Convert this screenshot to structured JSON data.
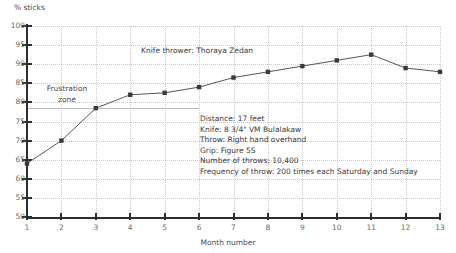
{
  "chart_data": {
    "type": "line",
    "title": "Knife thrower: Thoraya Zedan",
    "xlabel": "Month number",
    "ylabel": "% sticks",
    "x": [
      1,
      2,
      3,
      4,
      5,
      6,
      7,
      8,
      9,
      10,
      11,
      12,
      13
    ],
    "values": [
      64,
      70,
      78.5,
      82,
      82.5,
      84,
      86.5,
      88,
      89.5,
      91,
      92.5,
      89,
      88
    ],
    "series": [
      {
        "name": "% sticks",
        "values": [
          64,
          70,
          78.5,
          82,
          82.5,
          84,
          86.5,
          88,
          89.5,
          91,
          92.5,
          89,
          88
        ]
      }
    ],
    "xlim": [
      1,
      13
    ],
    "ylim": [
      50,
      100
    ],
    "ytick_labels": [
      "50",
      "55",
      "60",
      "65",
      "70",
      "75",
      "80",
      "85",
      "90",
      "95",
      "100"
    ],
    "yticks": [
      50,
      55,
      60,
      65,
      70,
      75,
      80,
      85,
      90,
      95,
      100
    ],
    "xtick_labels": [
      "1",
      "2",
      "3",
      "4",
      "5",
      "6",
      "7",
      "8",
      "9",
      "10",
      "11",
      "12",
      "13"
    ],
    "xticks": [
      1,
      2,
      3,
      4,
      5,
      6,
      7,
      8,
      9,
      10,
      11,
      12,
      13
    ],
    "grid": true,
    "legend": "none",
    "marker": "square",
    "line_color": "#555555",
    "marker_color": "#3a3a3a",
    "annotations": {
      "zone_label_line1": "Frustration",
      "zone_label_line2": "zone",
      "zone_boundary_value": 78.5,
      "zone_boundary_x_end": 6
    },
    "details": [
      "Distance: 17 feet",
      "Knife: 8 3/4\" VM Bulalakaw",
      "Throw: Right hand overhand",
      "Grip: Figure 5S",
      "Number of throws: 10,400",
      "Frequency of throw: 200 times each Saturday and Sunday"
    ]
  }
}
